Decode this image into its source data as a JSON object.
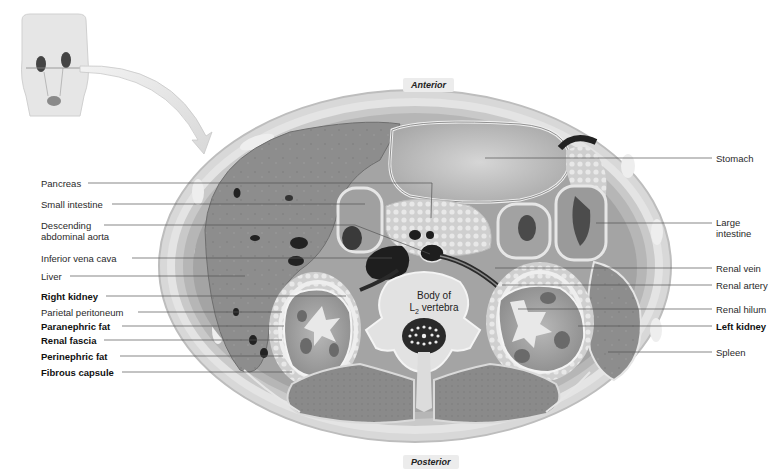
{
  "orientation": {
    "anterior": "Anterior",
    "posterior": "Posterior"
  },
  "vertebra_label": {
    "line1": "Body of",
    "line2_prefix": "L",
    "line2_sub": "2",
    "line2_suffix": " vertebra"
  },
  "left_labels": [
    {
      "id": "pancreas",
      "text": "Pancreas",
      "bold": false
    },
    {
      "id": "small-intestine",
      "text": "Small intestine",
      "bold": false
    },
    {
      "id": "descending-aorta",
      "text": "Descending\nabdominal aorta",
      "line1": "Descending",
      "line2": "abdominal aorta",
      "bold": false
    },
    {
      "id": "inferior-vena-cava",
      "text": "Inferior vena cava",
      "bold": false
    },
    {
      "id": "liver",
      "text": "Liver",
      "bold": false
    },
    {
      "id": "right-kidney",
      "text": "Right kidney",
      "bold": true
    },
    {
      "id": "parietal-peritoneum",
      "text": "Parietal peritoneum",
      "bold": false
    },
    {
      "id": "paranephric-fat",
      "text": "Paranephric fat",
      "bold": true
    },
    {
      "id": "renal-fascia",
      "text": "Renal fascia",
      "bold": true
    },
    {
      "id": "perinephric-fat",
      "text": "Perinephric fat",
      "bold": true
    },
    {
      "id": "fibrous-capsule",
      "text": "Fibrous capsule",
      "bold": true
    }
  ],
  "right_labels": [
    {
      "id": "stomach",
      "text": "Stomach",
      "bold": false
    },
    {
      "id": "large-intestine",
      "line1": "Large",
      "line2": "intestine",
      "bold": false
    },
    {
      "id": "renal-vein",
      "text": "Renal vein",
      "bold": false
    },
    {
      "id": "renal-artery",
      "text": "Renal artery",
      "bold": false
    },
    {
      "id": "renal-hilum",
      "text": "Renal hilum",
      "bold": false
    },
    {
      "id": "left-kidney",
      "text": "Left kidney",
      "bold": true
    },
    {
      "id": "spleen",
      "text": "Spleen",
      "bold": false
    }
  ],
  "colors": {
    "tissue_dark": "#7a7a7a",
    "tissue_mid": "#9a9a9a",
    "tissue_light": "#c8c8c8",
    "fat": "#dcdcdc",
    "vessel": "#1e1e1e",
    "leader": "#555555"
  }
}
